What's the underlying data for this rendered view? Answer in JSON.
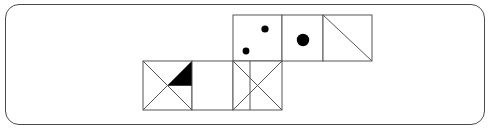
{
  "frame": {
    "shape": "rounded-rectangle",
    "stroke_color": "#4a4a4a",
    "fill_color": "#ffffff",
    "corner_radius": 14,
    "x": 5,
    "y": 4,
    "width": 480,
    "height": 121
  },
  "figure": {
    "title": "",
    "stroke_color": "#555555",
    "fill_black": "#000000",
    "line_width": 1,
    "cell_size": 49,
    "grid": {
      "top_row_y": 15,
      "bottom_row_y": 61,
      "bottom_row_bottom": 110,
      "top_row_left": 233,
      "bottom_row_left": 143
    },
    "faces": [
      {
        "id": "face-two-dots",
        "row": "top",
        "x": 233,
        "y": 15,
        "width": 49,
        "height": 46,
        "pattern": "dots",
        "dot_count": 2,
        "dots": [
          {
            "cx": 265,
            "cy": 29,
            "r": 3.6
          },
          {
            "cx": 246,
            "cy": 51,
            "r": 3.4
          }
        ]
      },
      {
        "id": "face-one-dot",
        "row": "top",
        "x": 282,
        "y": 15,
        "width": 41,
        "height": 46,
        "pattern": "dots",
        "dot_count": 1,
        "dots": [
          {
            "cx": 303,
            "cy": 40,
            "r": 6.2
          }
        ]
      },
      {
        "id": "face-diagonal",
        "row": "top",
        "x": 323,
        "y": 15,
        "width": 49,
        "height": 46,
        "pattern": "diagonal",
        "diagonal": "top-left-to-bottom-right"
      },
      {
        "id": "face-x-black-triangle",
        "row": "bottom",
        "x": 143,
        "y": 61,
        "width": 49,
        "height": 49,
        "pattern": "x-cross-with-filled-triangle",
        "filled_triangle": "top-right"
      },
      {
        "id": "face-empty",
        "row": "bottom",
        "x": 192,
        "y": 61,
        "width": 41,
        "height": 49,
        "pattern": "empty"
      },
      {
        "id": "face-x-vertical",
        "row": "bottom",
        "x": 233,
        "y": 61,
        "width": 49,
        "height": 49,
        "pattern": "x-cross-with-vertical-line",
        "vertical_line_offset": 17
      }
    ]
  }
}
